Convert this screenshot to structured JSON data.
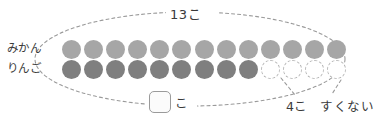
{
  "diagram": {
    "type": "dot-comparison-model",
    "language": "ja",
    "canvas": {
      "width": 381,
      "height": 119,
      "background": "#ffffff"
    },
    "rows": [
      {
        "key": "mikan",
        "label": "みかん",
        "fill_color": "#a6a6a6",
        "filled_count": 13,
        "empty_count": 0,
        "total_slots": 13
      },
      {
        "key": "ringo",
        "label": "りんご",
        "fill_color": "#7f7f7f",
        "empty_outline_color": "#b4b4b4",
        "filled_count": 9,
        "empty_count": 4,
        "total_slots": 13
      }
    ],
    "group_outline": {
      "shape": "ellipse",
      "style": "dashed",
      "color": "#9a9a9a"
    },
    "annotations": {
      "total_label": "13こ",
      "difference_label": "4こ",
      "comparison_label": "すくない",
      "answer_unit": "こ",
      "answer_value": "",
      "answer_placeholder": ""
    },
    "colors": {
      "text": "#3a3a3a",
      "dash": "#9a9a9a",
      "box_border": "#9a9a9a",
      "box_fill": "#fbfbfb"
    }
  },
  "chart_data": {
    "type": "bar",
    "title": "13こ",
    "categories": [
      "みかん",
      "りんご"
    ],
    "values": [
      13,
      9
    ],
    "unit": "こ",
    "annotations": [
      "4こ",
      "すくない"
    ],
    "xlabel": "",
    "ylabel": "",
    "ylim": [
      0,
      13
    ]
  }
}
